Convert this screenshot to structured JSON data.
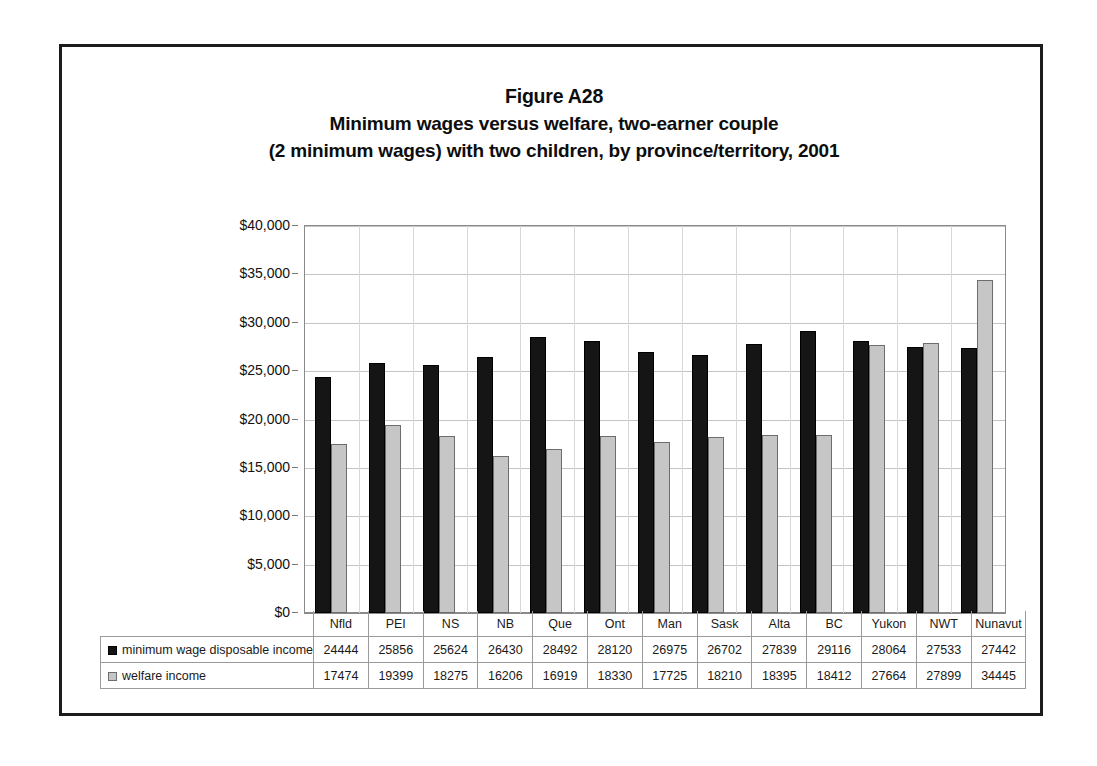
{
  "figure": {
    "title_lines": [
      "Figure A28",
      "Minimum wages versus welfare, two-earner couple",
      "(2 minimum wages) with two children, by province/territory, 2001"
    ]
  },
  "legend": {
    "series1_label": "minimum wage disposable income",
    "series1_swatch": "black-square-icon",
    "series2_label": "welfare income",
    "series2_swatch": "gray-square-icon"
  },
  "chart_data": {
    "type": "bar",
    "xlabel": "",
    "ylabel": "",
    "ylim": [
      0,
      40000
    ],
    "ytick_labels": [
      "$0",
      "$5,000",
      "$10,000",
      "$15,000",
      "$20,000",
      "$25,000",
      "$30,000",
      "$35,000",
      "$40,000"
    ],
    "ytick_values": [
      0,
      5000,
      10000,
      15000,
      20000,
      25000,
      30000,
      35000,
      40000
    ],
    "grid": true,
    "legend_position": "table-below",
    "categories": [
      "Nfld",
      "PEI",
      "NS",
      "NB",
      "Que",
      "Ont",
      "Man",
      "Sask",
      "Alta",
      "BC",
      "Yukon",
      "NWT",
      "Nunavut"
    ],
    "series": [
      {
        "name": "minimum wage disposable income",
        "color": "#151515",
        "values": [
          24444,
          25856,
          25624,
          26430,
          28492,
          28120,
          26975,
          26702,
          27839,
          29116,
          28064,
          27533,
          27442
        ]
      },
      {
        "name": "welfare income",
        "color": "#c6c6c6",
        "values": [
          17474,
          19399,
          18275,
          16206,
          16919,
          18330,
          17725,
          18210,
          18395,
          18412,
          27664,
          27899,
          34445
        ]
      }
    ]
  }
}
